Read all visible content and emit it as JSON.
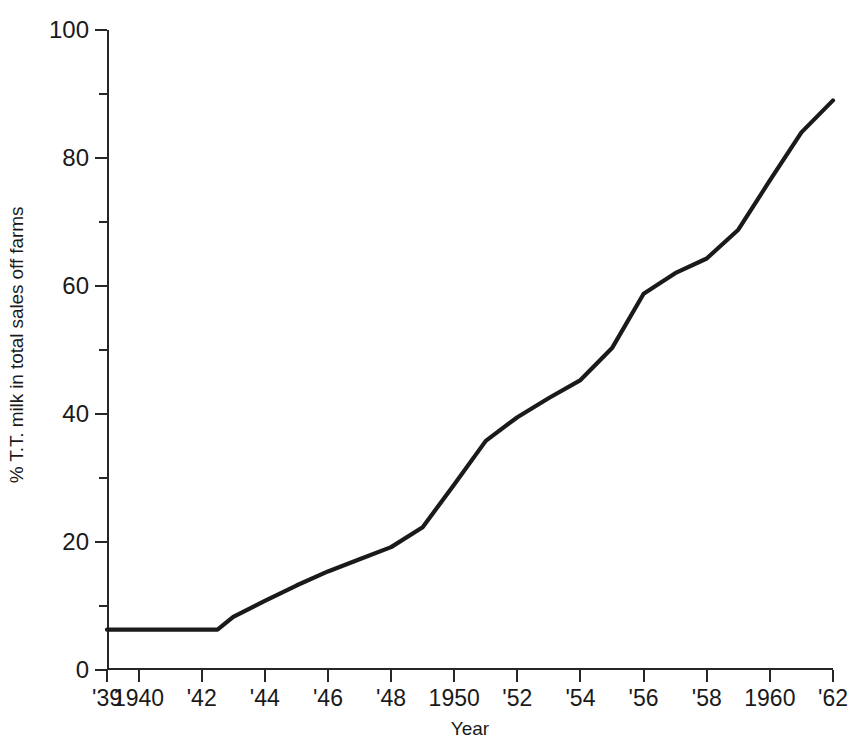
{
  "figure": {
    "top_cut_text": "",
    "background_color": "#ffffff",
    "line_color": "#1a1a1a",
    "axis_color": "#262626"
  },
  "chart_data": {
    "type": "line",
    "title": "",
    "xlabel": "Year",
    "ylabel": "% T.T. milk in total sales off farms",
    "xlim": [
      1939,
      1962
    ],
    "ylim": [
      0,
      100
    ],
    "grid": false,
    "legend": "none",
    "x_tick_labels": [
      "'39",
      "1940",
      "'42",
      "'44",
      "'46",
      "'48",
      "1950",
      "'52",
      "'54",
      "'56",
      "'58",
      "1960",
      "'62"
    ],
    "x_tick_values": [
      1939,
      1940,
      1942,
      1944,
      1946,
      1948,
      1950,
      1952,
      1954,
      1956,
      1958,
      1960,
      1962
    ],
    "y_tick_labels": [
      "0",
      "20",
      "40",
      "60",
      "80",
      "100"
    ],
    "y_tick_values": [
      0,
      20,
      40,
      60,
      80,
      100
    ],
    "y_minor_tick_values": [
      10,
      30,
      50,
      70,
      90
    ],
    "series": [
      {
        "name": "% T.T. milk in total sales off farms",
        "color": "#1a1a1a",
        "x": [
          1939,
          1940,
          1941,
          1942,
          1942.5,
          1943,
          1944,
          1945,
          1946,
          1947,
          1948,
          1949,
          1950,
          1951,
          1952,
          1953,
          1954,
          1955,
          1956,
          1957,
          1958,
          1959,
          1960,
          1961,
          1962
        ],
        "values": [
          6.3,
          6.3,
          6.3,
          6.3,
          6.3,
          8.3,
          10.8,
          13.2,
          15.4,
          17.3,
          19.2,
          22.3,
          29.0,
          35.8,
          39.5,
          42.5,
          45.3,
          50.3,
          58.8,
          62.0,
          64.3,
          68.8,
          76.5,
          84.0,
          89.0
        ]
      }
    ],
    "annotations": []
  }
}
